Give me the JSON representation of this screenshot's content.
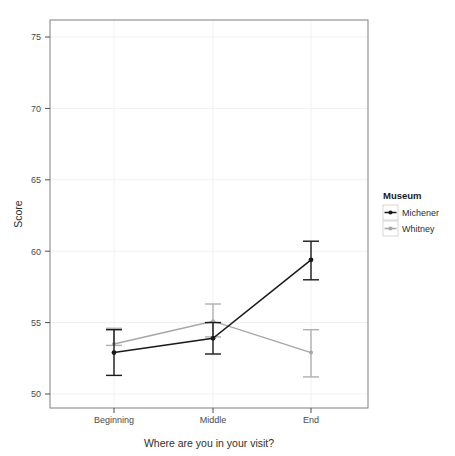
{
  "chart_data": {
    "type": "line",
    "title": "",
    "xlabel": "Where are you in your visit?",
    "ylabel": "Score",
    "categories": [
      "Beginning",
      "Middle",
      "End"
    ],
    "ylim": [
      49,
      76.5
    ],
    "yticks": [
      50,
      55,
      60,
      65,
      70,
      75
    ],
    "ytick_labels": [
      "50",
      "55",
      "60",
      "65",
      "70",
      "75"
    ],
    "grid": true,
    "legend_position": "right",
    "legend_title": "Museum",
    "series": [
      {
        "name": "Michener",
        "color": "#1a1a1a",
        "values": [
          52.9,
          53.9,
          59.4
        ],
        "err_low": [
          51.3,
          52.8,
          58.0
        ],
        "err_high": [
          54.5,
          55.0,
          60.7
        ]
      },
      {
        "name": "Whitney",
        "color": "#a6a6a6",
        "values": [
          53.5,
          55.1,
          52.9
        ],
        "err_low": [
          53.4,
          54.0,
          51.2
        ],
        "err_high": [
          54.6,
          56.3,
          54.5
        ]
      }
    ]
  },
  "axes": {
    "y_title": "Score",
    "x_title": "Where are you in your visit?",
    "y_tick_0": "50",
    "y_tick_1": "55",
    "y_tick_2": "60",
    "y_tick_3": "65",
    "y_tick_4": "70",
    "y_tick_5": "75",
    "x_tick_0": "Beginning",
    "x_tick_1": "Middle",
    "x_tick_2": "End"
  },
  "legend": {
    "title": "Museum",
    "items": [
      {
        "label": "Michener",
        "color": "#1a1a1a"
      },
      {
        "label": "Whitney",
        "color": "#a6a6a6"
      }
    ]
  }
}
